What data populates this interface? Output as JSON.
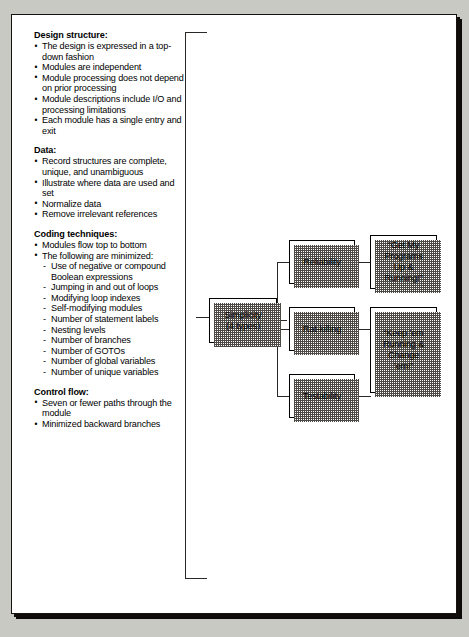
{
  "text_panel": {
    "sections": [
      {
        "heading": "Design structure:",
        "items": [
          "The design is expressed in a top-down fashion",
          "Modules are independent",
          "Module processing does not depend on prior processing",
          "Module descriptions include I/O and processing limitations",
          "Each module has a single entry and exit"
        ]
      },
      {
        "heading": "Data:",
        "items": [
          "Record structures are complete, unique, and unambiguous",
          "Illustrate where data are used and set",
          "Normalize data",
          "Remove irrelevant references"
        ]
      },
      {
        "heading": "Coding techniques:",
        "items": [
          "Modules flow top to bottom",
          "The following are minimized:"
        ],
        "subitems": [
          "Use of negative or compound Boolean expressions",
          "Jumping in and out of loops",
          "Modifying loop indexes",
          "Self-modifying modules",
          "Number of statement labels",
          "Nesting levels",
          "Number of branches",
          "Number of GOTOs",
          "Number of global variables",
          "Number of unique variables"
        ]
      },
      {
        "heading": "Control flow:",
        "items": [
          "Seven or fewer paths through the module",
          "Minimized backward branches"
        ]
      }
    ]
  },
  "flow": {
    "simplicity": "Simplicity\n(4 types)",
    "reliability": "Reliability",
    "rat_killing": "Rat-killing",
    "testability": "Testability",
    "callout_1": "“Get My\nPrograms\nUp &\nRunning!”",
    "callout_2": "“Keep ’em\nRunning &\nChange\n’em!”"
  },
  "colors": {
    "page_background": "#c9c9c4",
    "paper": "#ffffff",
    "ink": "#000000",
    "connector": "#2a2724",
    "shadow_dither": "#4d4a46"
  }
}
